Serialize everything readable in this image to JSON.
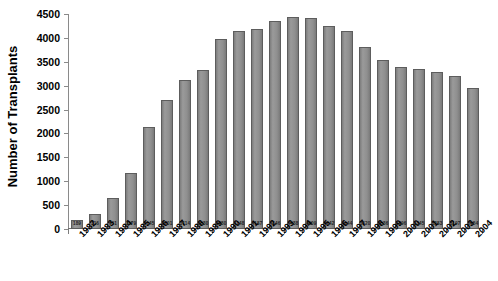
{
  "chart_data": {
    "type": "bar",
    "title": "",
    "xlabel": "",
    "ylabel": "Number of Transplants",
    "ylim": [
      0,
      4500
    ],
    "ytick_step": 500,
    "grid": false,
    "legend": null,
    "bar_color": "#8c8c8c",
    "bar_edge_color": "#5d5d5d",
    "categories": [
      "1982",
      "1983",
      "1984",
      "1985",
      "1986",
      "1987",
      "1988",
      "1989",
      "1990",
      "1991",
      "1992",
      "1993",
      "1994",
      "1995",
      "1996",
      "1997",
      "1998",
      "1999",
      "2000",
      "2001",
      "2002",
      "2003",
      "2004"
    ],
    "values": [
      189,
      316,
      651,
      1179,
      2145,
      2701,
      3114,
      3330,
      3980,
      4148,
      4187,
      4346,
      4438,
      4409,
      4242,
      4144,
      3820,
      3536,
      3396,
      3345,
      3283,
      3197,
      2954
    ],
    "ytick_labels": [
      "4500",
      "4000",
      "3500",
      "3000",
      "2500",
      "2000",
      "1500",
      "1000",
      "500",
      "0"
    ],
    "ytick_values": [
      4500,
      4000,
      3500,
      3000,
      2500,
      2000,
      1500,
      1000,
      500,
      0
    ]
  },
  "axis": {
    "y_title": "Number of Transplants"
  }
}
